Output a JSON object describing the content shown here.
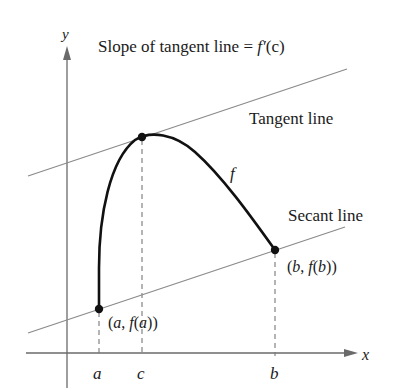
{
  "figure": {
    "title": "Slope of tangent line = f′(c)",
    "title_parts": {
      "prefix": "Slope of tangent line = ",
      "func": "f′",
      "arg": "(c)"
    },
    "axes": {
      "x_label": "x",
      "y_label": "y"
    },
    "curve_label": "f",
    "tangent_label": "Tangent line",
    "secant_label": "Secant line",
    "ticks": {
      "a": "a",
      "c": "c",
      "b": "b"
    },
    "points": {
      "a": {
        "label": "(a, f(a))",
        "parts": [
          "(",
          "a",
          ", ",
          "f",
          "(",
          "a",
          "))"
        ]
      },
      "b": {
        "label": "(b, f(b))",
        "parts": [
          "(",
          "b",
          ", ",
          "f",
          "(",
          "b",
          "))"
        ]
      },
      "c": {
        "label": ""
      }
    },
    "colors": {
      "curve": "#111111",
      "lines": "#8a8a8a",
      "axes": "#6a6a6a",
      "dashes": "#777777"
    }
  }
}
